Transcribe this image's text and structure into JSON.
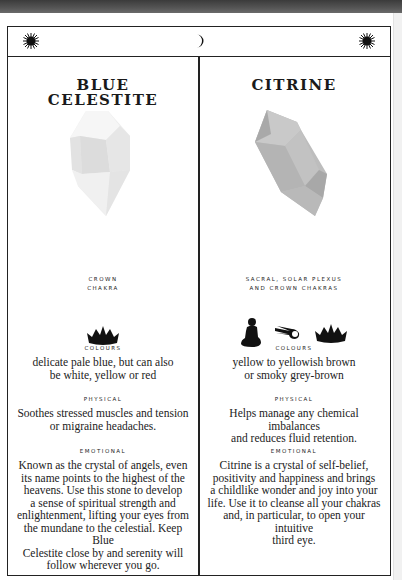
{
  "header": {
    "left_icon": "sun-icon",
    "center_icon": "crescent-moon-icon",
    "right_icon": "sun-icon"
  },
  "columns": [
    {
      "title_line1": "BLUE",
      "title_line2": "CELESTITE",
      "crystal_icon": "pale-crystal-illustration",
      "chakra_line1": "CROWN",
      "chakra_line2": "CHAKRA",
      "chakra_icons": [
        "crown-icon"
      ],
      "colours_label": "COLOURS",
      "colours_line1": "delicate pale blue, but can also",
      "colours_line2": "be white, yellow or red",
      "physical_label": "PHYSICAL",
      "physical_line1": "Soothes stressed muscles and tension",
      "physical_line2": "or migraine headaches.",
      "emotional_label": "EMOTIONAL",
      "emotional_lines": [
        "Known as the crystal of angels, even",
        "its name points to the highest of the",
        "heavens. Use this stone to develop",
        "a sense of spiritual strength and",
        "enlightenment, lifting your eyes from",
        "the mundane to the celestial. Keep Blue",
        "Celestite close by and serenity will",
        "follow wherever you go."
      ]
    },
    {
      "title_line1": "CITRINE",
      "title_line2": "",
      "crystal_icon": "grey-crystal-illustration",
      "chakra_line1": "SACRAL, SOLAR PLEXUS",
      "chakra_line2": "AND CROWN CHAKRAS",
      "chakra_icons": [
        "meditating-figure-icon",
        "comet-icon",
        "crown-icon"
      ],
      "colours_label": "COLOURS",
      "colours_line1": "yellow to yellowish brown",
      "colours_line2": "or smoky grey-brown",
      "physical_label": "PHYSICAL",
      "physical_line1": "Helps manage any chemical imbalances",
      "physical_line2": "and reduces fluid retention.",
      "emotional_label": "EMOTIONAL",
      "emotional_lines": [
        "Citrine is a crystal of self-belief,",
        "positivity and happiness and brings",
        "a childlike wonder and joy into your",
        "life. Use it to cleanse all your chakras",
        "and, in particular, to open your intuitive",
        "third eye."
      ]
    }
  ],
  "colors": {
    "ink": "#1a1a1a",
    "frame": "#222222",
    "top_band": "#4a4a4a"
  }
}
